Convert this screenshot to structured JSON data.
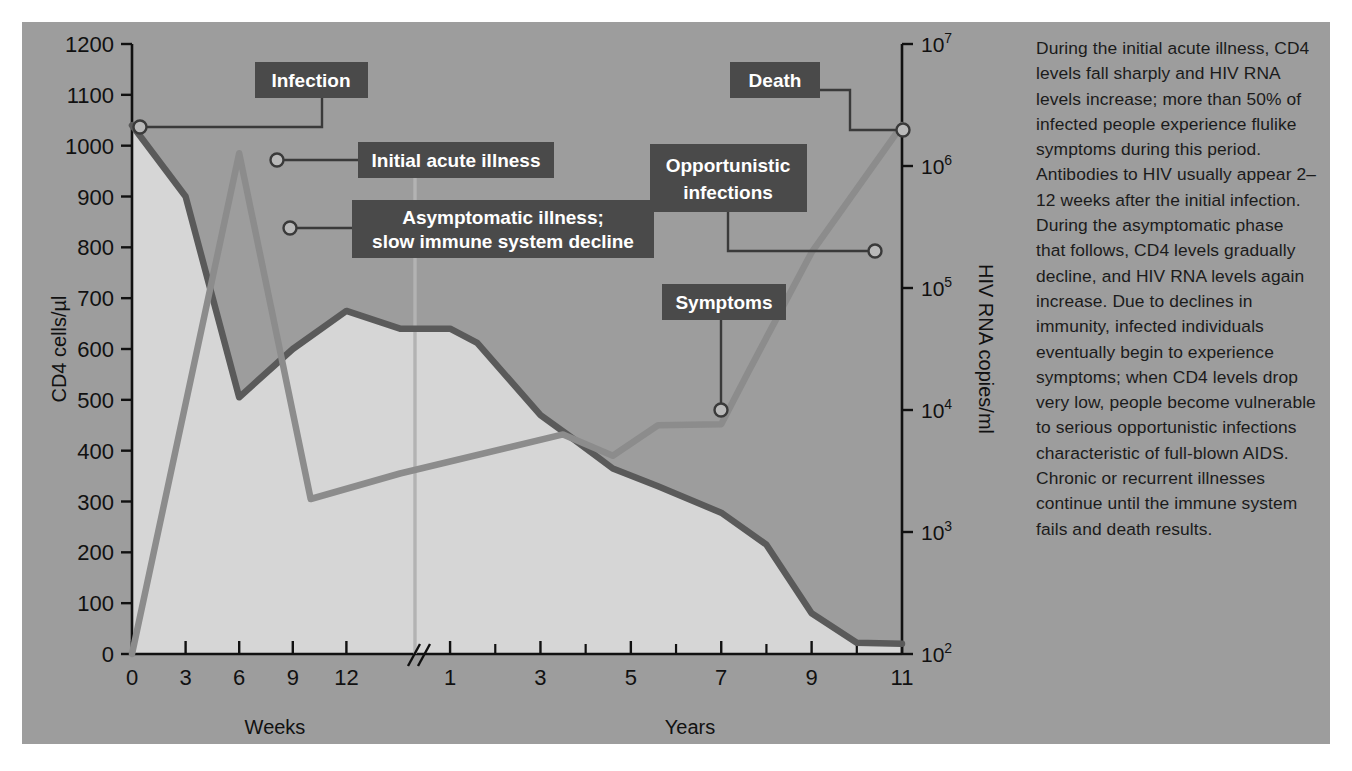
{
  "figure": {
    "panel_bg": "#9d9d9d",
    "fill_color": "#d6d6d6",
    "cd4_color": "#5a5a5a",
    "rna_color": "#8c8c8c",
    "callout_bg": "#4a4a4a",
    "callout_fg": "#ffffff"
  },
  "chart_data": {
    "type": "line",
    "title": "",
    "xlabel_left": "Weeks",
    "xlabel_right": "Years",
    "ylabel_left": "CD4 cells/µl",
    "ylabel_right": "HIV RNA copies/ml",
    "grid": false,
    "legend": "none",
    "axis_break": true,
    "x_weeks_ticks": [
      "0",
      "3",
      "6",
      "9",
      "12"
    ],
    "x_years_ticks": [
      "1",
      "3",
      "5",
      "7",
      "9",
      "11"
    ],
    "x_years_minor_ticks": [
      "2",
      "4",
      "6",
      "8",
      "10"
    ],
    "ylim_left": [
      0,
      1200
    ],
    "y_left_ticks": [
      "0",
      "100",
      "200",
      "300",
      "400",
      "500",
      "600",
      "700",
      "800",
      "900",
      "1000",
      "1100",
      "1200"
    ],
    "ylim_right_log": [
      2,
      7
    ],
    "y_right_ticks": [
      "10²",
      "10³",
      "10⁴",
      "10⁵",
      "10⁶",
      "10⁷"
    ],
    "y_right_tick_exponents": [
      "2",
      "3",
      "4",
      "5",
      "6",
      "7"
    ],
    "series": [
      {
        "name": "CD4 cells/µl",
        "axis": "left",
        "color": "#5a5a5a",
        "filled": true,
        "points": [
          {
            "phase": "weeks",
            "x": 0,
            "y": 1040
          },
          {
            "phase": "weeks",
            "x": 3,
            "y": 900
          },
          {
            "phase": "weeks",
            "x": 6,
            "y": 505
          },
          {
            "phase": "weeks",
            "x": 9,
            "y": 600
          },
          {
            "phase": "weeks",
            "x": 12,
            "y": 675
          },
          {
            "phase": "weeks",
            "x": 15,
            "y": 640
          },
          {
            "phase": "years",
            "x": 1,
            "y": 640
          },
          {
            "phase": "years",
            "x": 1.6,
            "y": 612
          },
          {
            "phase": "years",
            "x": 3,
            "y": 470
          },
          {
            "phase": "years",
            "x": 3.7,
            "y": 425
          },
          {
            "phase": "years",
            "x": 4.6,
            "y": 365
          },
          {
            "phase": "years",
            "x": 5.6,
            "y": 330
          },
          {
            "phase": "years",
            "x": 7,
            "y": 278
          },
          {
            "phase": "years",
            "x": 8,
            "y": 215
          },
          {
            "phase": "years",
            "x": 9,
            "y": 80
          },
          {
            "phase": "years",
            "x": 10,
            "y": 22
          },
          {
            "phase": "years",
            "x": 11,
            "y": 20
          }
        ]
      },
      {
        "name": "HIV RNA copies/ml",
        "axis": "right",
        "color": "#8c8c8c",
        "filled": false,
        "points": [
          {
            "phase": "weeks",
            "x": 0,
            "y_left_equiv": 0,
            "rna": 100
          },
          {
            "phase": "weeks",
            "x": 6,
            "y_left_equiv": 985,
            "rna": 1200000
          },
          {
            "phase": "weeks",
            "x": 10,
            "y_left_equiv": 305,
            "rna": 2000
          },
          {
            "phase": "weeks",
            "x": 15,
            "y_left_equiv": 355,
            "rna": 3000
          },
          {
            "phase": "years",
            "x": 3.5,
            "y_left_equiv": 432,
            "rna": 7000
          },
          {
            "phase": "years",
            "x": 4.6,
            "y_left_equiv": 390,
            "rna": 5000
          },
          {
            "phase": "years",
            "x": 5.6,
            "y_left_equiv": 450,
            "rna": 8500
          },
          {
            "phase": "years",
            "x": 7,
            "y_left_equiv": 452,
            "rna": 9000
          },
          {
            "phase": "years",
            "x": 7.6,
            "y_left_equiv": 555,
            "rna": 30000
          },
          {
            "phase": "years",
            "x": 9,
            "y_left_equiv": 790,
            "rna": 380000
          },
          {
            "phase": "years",
            "x": 11,
            "y_left_equiv": 1040,
            "rna": 2500000
          }
        ]
      }
    ],
    "annotations": [
      {
        "id": "infection",
        "label": "Infection",
        "marker_phase": "weeks",
        "marker_x": 0,
        "marker_value": 1040
      },
      {
        "id": "initial-acute-illness",
        "label": "Initial acute illness",
        "marker_phase": "weeks",
        "marker_x": 6.8,
        "marker_value": 980
      },
      {
        "id": "asymptomatic",
        "label_line1": "Asymptomatic illness;",
        "label_line2": "slow immune system decline",
        "marker_phase": "weeks",
        "marker_x": 7.2,
        "marker_value": 808
      },
      {
        "id": "symptoms",
        "label": "Symptoms",
        "marker_phase": "years",
        "marker_x": 7,
        "marker_value": 492
      },
      {
        "id": "opportunistic-infections",
        "label_line1": "Opportunistic",
        "label_line2": "infections",
        "marker_phase": "years",
        "marker_x": 9.1,
        "marker_value": 852
      },
      {
        "id": "death",
        "label": "Death",
        "marker_phase": "years",
        "marker_x": 10.4,
        "marker_value": 1040
      }
    ]
  },
  "sidebar_text": {
    "paragraph": "During the initial acute illness, CD4 levels fall sharply and HIV RNA levels increase; more than 50% of infected people experience flulike symptoms during this period. Antibodies to HIV usually appear 2–12 weeks after the initial infection. During the asymptomatic phase that follows, CD4 levels gradually decline, and HIV RNA levels again increase. Due to declines in immunity, infected individuals eventually begin to experience symptoms; when CD4 levels drop very low, people become vulnerable to serious opportunistic infections characteristic of full-blown AIDS. Chronic or recurrent illnesses continue until the immune system fails and death results."
  }
}
